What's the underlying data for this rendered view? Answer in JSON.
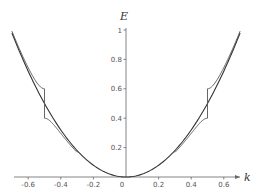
{
  "chart_data": {
    "type": "line",
    "title": "",
    "xlabel": "k",
    "ylabel": "E",
    "xlim": [
      -0.7,
      0.7
    ],
    "ylim": [
      0,
      1
    ],
    "xticks": [
      -0.6,
      -0.4,
      -0.2,
      0,
      0.2,
      0.4,
      0.6
    ],
    "xtick_labels": [
      "-0.6",
      "-0.4",
      "-0.2",
      "0",
      "0.2",
      "0.4",
      "0.6"
    ],
    "yticks": [
      0.2,
      0.4,
      0.6,
      0.8,
      1
    ],
    "ytick_labels": [
      "0.2",
      "0.4",
      "0.6",
      "0.8",
      "1"
    ],
    "grid": false,
    "legend": "none",
    "series": [
      {
        "name": "free-electron",
        "formula": "E = 2k^2",
        "x": [
          -0.7,
          -0.6,
          -0.5,
          -0.4,
          -0.3,
          -0.2,
          -0.1,
          0,
          0.1,
          0.2,
          0.3,
          0.4,
          0.5,
          0.6,
          0.7
        ],
        "y": [
          0.98,
          0.72,
          0.5,
          0.32,
          0.18,
          0.08,
          0.02,
          0,
          0.02,
          0.08,
          0.18,
          0.32,
          0.5,
          0.72,
          0.98
        ]
      },
      {
        "name": "nearly-free-electron bands",
        "description": "Band structure with energy gaps at zone boundary k = ±0.5",
        "gap_k": [
          -0.5,
          0.5
        ],
        "gap_E_range": [
          0.4,
          0.6
        ],
        "x": [
          -0.7,
          -0.6,
          -0.5,
          -0.5,
          -0.4,
          -0.3,
          -0.2,
          -0.1,
          0,
          0.1,
          0.2,
          0.3,
          0.4,
          0.5,
          0.5,
          0.6,
          0.7
        ],
        "y": [
          0.98,
          0.75,
          0.6,
          0.4,
          0.3,
          0.18,
          0.08,
          0.02,
          0,
          0.02,
          0.08,
          0.18,
          0.3,
          0.4,
          0.6,
          0.75,
          0.98
        ]
      }
    ]
  }
}
